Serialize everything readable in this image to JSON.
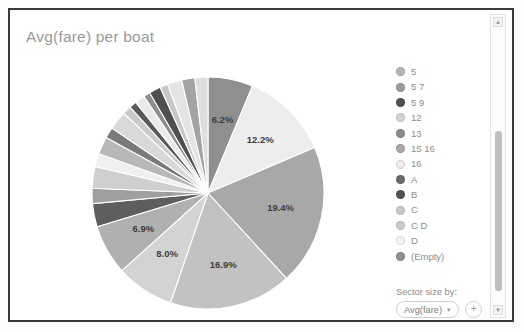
{
  "card": {
    "title": "Avg(fare) per boat"
  },
  "legend": {
    "items": [
      {
        "label": "5",
        "color": "#b6b6b6"
      },
      {
        "label": "5 7",
        "color": "#9d9d9d"
      },
      {
        "label": "5 9",
        "color": "#4f4f4f"
      },
      {
        "label": "12",
        "color": "#d5d5d5"
      },
      {
        "label": "13",
        "color": "#8a8a8a"
      },
      {
        "label": "15 16",
        "color": "#a8a8a8"
      },
      {
        "label": "16",
        "color": "#ededed"
      },
      {
        "label": "A",
        "color": "#6b6b6b"
      },
      {
        "label": "B",
        "color": "#525252"
      },
      {
        "label": "C",
        "color": "#c9c9c9"
      },
      {
        "label": "C D",
        "color": "#cbcbcb"
      },
      {
        "label": "D",
        "color": "#f4f4f4"
      },
      {
        "label": "(Empty)",
        "color": "#8f8f8f"
      }
    ]
  },
  "sector_size": {
    "caption": "Sector size by:",
    "selected": "Avg(fare)",
    "caret": "▾",
    "add_label": "+"
  },
  "scrollbar": {
    "up_arrow": "▲",
    "down_arrow": "▼"
  },
  "chart_data": {
    "type": "pie",
    "title": "Avg(fare) per boat",
    "legend_position": "right",
    "value_field": "Avg(fare)",
    "category_field": "boat",
    "units": "percent",
    "labels_shown_threshold_pct": 6,
    "categories": [
      "(Empty)",
      "16",
      "15 16",
      "5 7",
      "12",
      "D",
      "C",
      "B",
      "A",
      "C D",
      "13",
      "5",
      "5 9",
      "slice-14",
      "slice-15",
      "slice-16",
      "slice-17",
      "slice-18",
      "slice-19",
      "slice-20",
      "slice-21",
      "slice-22"
    ],
    "values": [
      6.2,
      12.2,
      19.4,
      16.9,
      8.0,
      6.9,
      3.2,
      2.1,
      3.0,
      1.8,
      2.4,
      1.5,
      2.6,
      1.2,
      1.0,
      1.4,
      0.9,
      1.6,
      1.1,
      2.0,
      1.8,
      1.8
    ],
    "labeled_slices": [
      {
        "label": "6.2%",
        "value": 6.2
      },
      {
        "label": "12.2%",
        "value": 12.2
      },
      {
        "label": "19.4%",
        "value": 19.4
      },
      {
        "label": "16.9%",
        "value": 16.9
      },
      {
        "label": "8.0%",
        "value": 8.0
      },
      {
        "label": "6.9%",
        "value": 6.9
      }
    ],
    "slice_colors": [
      "#8f8f8f",
      "#ededed",
      "#a8a8a8",
      "#c2c2c2",
      "#d3d3d3",
      "#b0b0b0",
      "#5e5e5e",
      "#9f9f9f",
      "#cfcfcf",
      "#efefef",
      "#b8b8b8",
      "#7a7a7a",
      "#d9d9d9",
      "#cacaca",
      "#5a5a5a",
      "#eaeaea",
      "#8d8d8d",
      "#4f4f4f",
      "#c6c6c6",
      "#e4e4e4",
      "#a3a3a3",
      "#dedede"
    ],
    "geometry": {
      "cx": 126,
      "cy": 123,
      "r": 116,
      "start_angle_deg": -90,
      "direction": "clockwise"
    }
  }
}
